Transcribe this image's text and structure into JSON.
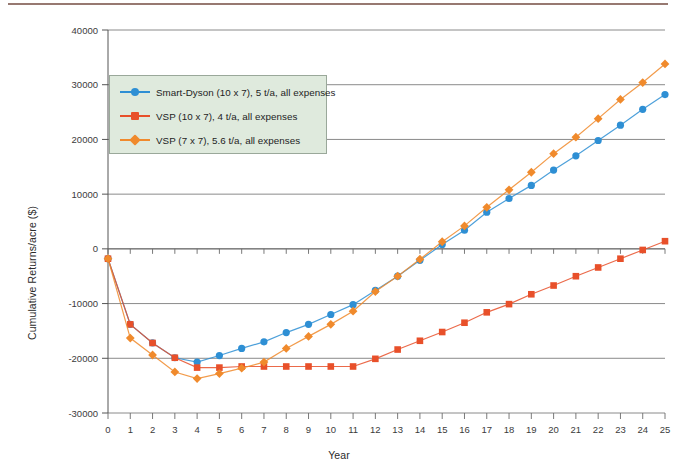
{
  "chart_data": {
    "type": "line",
    "title": "",
    "xlabel": "Year",
    "ylabel": "Cumulative Returns/acre ($)",
    "xlim": [
      0,
      25
    ],
    "ylim": [
      -30000,
      40000
    ],
    "xticks": [
      0,
      1,
      2,
      3,
      4,
      5,
      6,
      7,
      8,
      9,
      10,
      11,
      12,
      13,
      14,
      15,
      16,
      17,
      18,
      19,
      20,
      21,
      22,
      23,
      24,
      25
    ],
    "yticks": [
      -30000,
      -20000,
      -10000,
      0,
      10000,
      20000,
      30000,
      40000
    ],
    "grid": "horizontal",
    "legend_position": "upper-left",
    "x": [
      0,
      1,
      2,
      3,
      4,
      5,
      6,
      7,
      8,
      9,
      10,
      11,
      12,
      13,
      14,
      15,
      16,
      17,
      18,
      19,
      20,
      21,
      22,
      23,
      24,
      25
    ],
    "series": [
      {
        "name": "Smart-Dyson (10 x 7), 5 t/a, all expenses",
        "color": "#2e8fd4",
        "marker": "circle",
        "values": [
          -1800,
          -13800,
          -17200,
          -19900,
          -20700,
          -19500,
          -18200,
          -17000,
          -15300,
          -13800,
          -12000,
          -10200,
          -7600,
          -5000,
          -2100,
          800,
          3400,
          6700,
          9200,
          11600,
          14400,
          17000,
          19800,
          22600,
          25500,
          28200
        ]
      },
      {
        "name": "VSP (10 x 7), 4 t/a, all expenses",
        "color": "#e8502a",
        "marker": "square",
        "values": [
          -1800,
          -13800,
          -17200,
          -19900,
          -21700,
          -21700,
          -21500,
          -21500,
          -21500,
          -21500,
          -21500,
          -21500,
          -20100,
          -18400,
          -16800,
          -15200,
          -13500,
          -11600,
          -10100,
          -8300,
          -6700,
          -5000,
          -3400,
          -1800,
          -200,
          1400
        ]
      },
      {
        "name": "VSP (7 x 7), 5.6 t/a, all expenses",
        "color": "#f08a2c",
        "marker": "diamond",
        "values": [
          -1800,
          -16300,
          -19400,
          -22500,
          -23700,
          -22800,
          -21800,
          -20700,
          -18200,
          -16000,
          -13800,
          -11400,
          -7800,
          -5000,
          -1900,
          1300,
          4200,
          7600,
          10800,
          14000,
          17400,
          20400,
          23800,
          27300,
          30400,
          33800
        ]
      }
    ]
  },
  "axis": {
    "y_title": "Cumulative Returns/acre ($)",
    "x_title": "Year"
  },
  "legend": {
    "items": [
      {
        "label": "Smart-Dyson (10 x 7), 5 t/a, all expenses",
        "color": "#2e8fd4",
        "marker": "circle"
      },
      {
        "label": "VSP (10 x 7), 4 t/a, all expenses",
        "color": "#e8502a",
        "marker": "square"
      },
      {
        "label": "VSP (7 x 7), 5.6 t/a, all expenses",
        "color": "#f08a2c",
        "marker": "diamond"
      }
    ],
    "background": "#dfeadd",
    "border": "#9aa89a"
  },
  "decor": {
    "top_rule_color": "#8c6a62"
  }
}
